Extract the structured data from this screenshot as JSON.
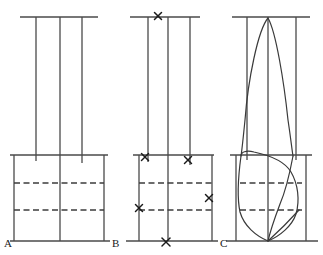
{
  "figure": {
    "name": "three-panel-line-diagram",
    "width": 323,
    "height": 255,
    "background": "#ffffff",
    "stroke_color": "#4a4a4a",
    "dash_color": "#3c3c3c",
    "curve_color": "#3a3a3a",
    "label_color": "#1a1a1a"
  },
  "panels": [
    {
      "id": "A",
      "label": "A",
      "label_x": 4,
      "label_y": 247,
      "x_left": 14,
      "x_right": 104,
      "verticals": [
        {
          "name": "outer-left",
          "x": 14,
          "y_top": 155,
          "y_bottom": 241
        },
        {
          "name": "inner-left",
          "x": 36,
          "y_top": 17,
          "y_bottom": 161
        },
        {
          "name": "center",
          "x": 60,
          "y_top": 17,
          "y_bottom": 241
        },
        {
          "name": "inner-right",
          "x": 82,
          "y_top": 17,
          "y_bottom": 163
        },
        {
          "name": "outer-right",
          "x": 104,
          "y_top": 155,
          "y_bottom": 241
        }
      ],
      "horizontals": [
        {
          "name": "top-rule",
          "y": 17,
          "x1": 20,
          "x2": 98
        },
        {
          "name": "mid-rule",
          "y": 155,
          "x1": 10,
          "x2": 108
        },
        {
          "name": "bottom-rule",
          "y": 241,
          "x1": 10,
          "x2": 110
        }
      ],
      "dashed": [
        {
          "name": "dash-upper",
          "y": 183,
          "x1": 14,
          "x2": 104
        },
        {
          "name": "dash-lower",
          "y": 210,
          "x1": 14,
          "x2": 104
        }
      ],
      "marks": [],
      "curves": []
    },
    {
      "id": "B",
      "label": "B",
      "label_x": 112,
      "label_y": 247,
      "x_left": 139,
      "x_right": 212,
      "verticals": [
        {
          "name": "outer-left",
          "x": 139,
          "y_top": 155,
          "y_bottom": 241
        },
        {
          "name": "inner-left",
          "x": 148,
          "y_top": 17,
          "y_bottom": 162
        },
        {
          "name": "center",
          "x": 168,
          "y_top": 17,
          "y_bottom": 241
        },
        {
          "name": "inner-right",
          "x": 190,
          "y_top": 17,
          "y_bottom": 165
        },
        {
          "name": "outer-right",
          "x": 212,
          "y_top": 155,
          "y_bottom": 241
        }
      ],
      "horizontals": [
        {
          "name": "top-rule",
          "y": 17,
          "x1": 130,
          "x2": 200
        },
        {
          "name": "mid-rule",
          "y": 155,
          "x1": 133,
          "x2": 214
        },
        {
          "name": "bottom-rule",
          "y": 241,
          "x1": 126,
          "x2": 218
        }
      ],
      "dashed": [
        {
          "name": "dash-upper",
          "y": 183,
          "x1": 139,
          "x2": 212
        },
        {
          "name": "dash-lower",
          "y": 210,
          "x1": 139,
          "x2": 212
        }
      ],
      "marks": [
        {
          "name": "x-mark-top-center",
          "x": 158,
          "y": 16,
          "size": 7
        },
        {
          "name": "x-mark-mid-left",
          "x": 145,
          "y": 157,
          "size": 7
        },
        {
          "name": "x-mark-mid-right",
          "x": 188,
          "y": 160,
          "size": 7
        },
        {
          "name": "x-mark-right-column",
          "x": 209,
          "y": 198,
          "size": 7
        },
        {
          "name": "x-mark-left-column",
          "x": 139,
          "y": 208,
          "size": 7
        },
        {
          "name": "x-mark-bottom-center",
          "x": 166,
          "y": 242,
          "size": 8
        }
      ],
      "curves": []
    },
    {
      "id": "C",
      "label": "C",
      "label_x": 220,
      "label_y": 247,
      "x_left": 247,
      "x_right": 296,
      "verticals": [
        {
          "name": "outer-left",
          "x": 236,
          "y_top": 155,
          "y_bottom": 241
        },
        {
          "name": "inner-left",
          "x": 247,
          "y_top": 17,
          "y_bottom": 160
        },
        {
          "name": "center",
          "x": 268,
          "y_top": 17,
          "y_bottom": 241
        },
        {
          "name": "inner-right",
          "x": 296,
          "y_top": 17,
          "y_bottom": 160
        },
        {
          "name": "outer-right",
          "x": 306,
          "y_top": 155,
          "y_bottom": 241
        }
      ],
      "horizontals": [
        {
          "name": "top-rule",
          "y": 17,
          "x1": 232,
          "x2": 310
        },
        {
          "name": "mid-rule",
          "y": 155,
          "x1": 230,
          "x2": 312
        },
        {
          "name": "bottom-rule",
          "y": 241,
          "x1": 226,
          "x2": 318
        }
      ],
      "dashed": [
        {
          "name": "dash-upper",
          "y": 183,
          "x1": 240,
          "x2": 302
        },
        {
          "name": "dash-lower",
          "y": 210,
          "x1": 240,
          "x2": 302
        }
      ],
      "marks": [],
      "curves": [
        {
          "name": "upper-lobe-curve",
          "path": "M 268 18 C 258 30 248 80 245 120 C 243 140 242 150 241 156 M 268 18 C 276 32 284 82 288 120 C 291 140 292 150 293 156"
        },
        {
          "name": "lower-lobe-curve",
          "path": "M 241 156 C 241 152 246 150 254 152 C 268 155 284 160 291 172 C 298 184 300 200 296 214 C 292 226 280 236 268 241 C 256 236 244 226 240 212 C 237 198 238 178 241 156 Z"
        },
        {
          "name": "lower-diagonal-chord",
          "path": "M 293 156 C 290 172 286 190 280 204 C 274 220 270 232 268 241"
        },
        {
          "name": "bottom-right-chord",
          "path": "M 268 241 C 278 232 290 220 299 210"
        }
      ]
    }
  ]
}
